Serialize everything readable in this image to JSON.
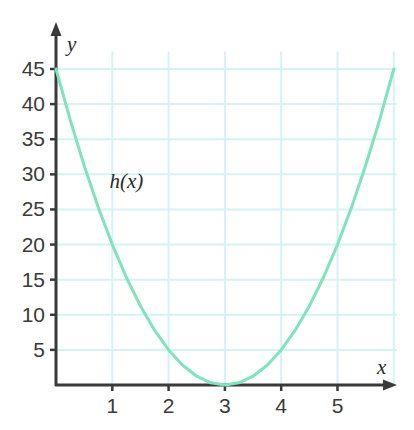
{
  "chart_data": {
    "type": "line",
    "title": "",
    "subtitle": "",
    "xlabel": "x",
    "ylabel": "y",
    "xlim": [
      -0.2,
      6.3
    ],
    "ylim": [
      0,
      48
    ],
    "grid": true,
    "legend_position": "inline-annotation",
    "annotations": [
      {
        "text": "h(x)",
        "x": 0.95,
        "y": 28
      }
    ],
    "x_ticks": [
      1,
      2,
      3,
      4,
      5
    ],
    "x_tick_labels": [
      "1",
      "2",
      "3",
      "4",
      "5"
    ],
    "y_ticks": [
      5,
      10,
      15,
      20,
      25,
      30,
      35,
      40,
      45
    ],
    "y_tick_labels": [
      "5",
      "10",
      "15",
      "20",
      "25",
      "30",
      "35",
      "40",
      "45"
    ],
    "series": [
      {
        "name": "h(x)",
        "equation": "h(x) = 5(x - 3)^2",
        "vertex": [
          3,
          0
        ],
        "color": "#7fe3bd",
        "x": [
          0,
          0.25,
          0.5,
          0.75,
          1,
          1.25,
          1.5,
          1.75,
          2,
          2.25,
          2.5,
          2.75,
          3,
          3.25,
          3.5,
          3.75,
          4,
          4.25,
          4.5,
          4.75,
          5,
          5.25,
          5.5,
          5.75,
          6
        ],
        "values": [
          45,
          37.8125,
          31.25,
          25.3125,
          20,
          15.3125,
          11.25,
          7.8125,
          5,
          2.8125,
          1.25,
          0.3125,
          0,
          0.3125,
          1.25,
          2.8125,
          5,
          7.8125,
          11.25,
          15.3125,
          20,
          25.3125,
          31.25,
          37.8125,
          45
        ]
      }
    ]
  },
  "colors": {
    "curve": "#7fe3bd",
    "grid": "#d6f2f2",
    "axis": "#3a3a3a",
    "label": "#3a3a3a",
    "background": "#ffffff"
  },
  "axes": {
    "x_axis_name": "x",
    "y_axis_name": "y"
  }
}
